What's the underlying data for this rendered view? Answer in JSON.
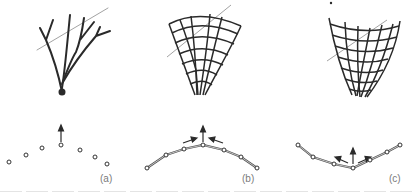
{
  "panels": [
    {
      "id": "a",
      "label": "(a)",
      "label_pos": [
        100,
        173
      ],
      "top_figure": "branching-tree",
      "bottom_figure": "unconnected-points-with-upward-arrow",
      "points": [
        [
          9,
          162
        ],
        [
          26,
          155
        ],
        [
          42,
          148
        ],
        [
          61,
          145
        ],
        [
          80,
          150
        ],
        [
          95,
          157
        ],
        [
          107,
          164
        ]
      ],
      "connected": false,
      "arrows": [
        [
          [
            61,
            142
          ],
          [
            61,
            127
          ]
        ]
      ]
    },
    {
      "id": "b",
      "label": "(b)",
      "label_pos": [
        243,
        173
      ],
      "top_figure": "fan-grid-diverging",
      "bottom_figure": "convex-chain-with-inward-arrows",
      "points": [
        [
          147,
          168
        ],
        [
          166,
          155
        ],
        [
          184,
          149
        ],
        [
          203,
          145
        ],
        [
          224,
          150
        ],
        [
          241,
          157
        ],
        [
          257,
          168
        ]
      ],
      "connected": true,
      "arrows": [
        [
          [
            203,
            142
          ],
          [
            203,
            127
          ]
        ],
        [
          [
            184,
            143
          ],
          [
            196,
            139
          ]
        ],
        [
          [
            222,
            143
          ],
          [
            210,
            139
          ]
        ]
      ]
    },
    {
      "id": "c",
      "label": "(c)",
      "label_pos": [
        390,
        173
      ],
      "top_figure": "funnel-grid-converging",
      "bottom_figure": "concave-chain-with-outward-arrows",
      "points": [
        [
          298,
          145
        ],
        [
          313,
          157
        ],
        [
          334,
          164
        ],
        [
          353,
          168
        ],
        [
          370,
          160
        ],
        [
          387,
          152
        ],
        [
          400,
          145
        ]
      ],
      "connected": true,
      "arrows": [
        [
          [
            353,
            165
          ],
          [
            353,
            149
          ]
        ],
        [
          [
            348,
            163
          ],
          [
            336,
            158
          ]
        ],
        [
          [
            358,
            163
          ],
          [
            370,
            158
          ]
        ]
      ]
    }
  ],
  "caption": {
    "visible": "clipped"
  },
  "colors": {
    "stroke": "#2a2a2a",
    "guide_line": "#8a8a8a",
    "point_fill": "#ffffff",
    "chain": "#9a9a9a",
    "label": "#7a7a7a"
  }
}
